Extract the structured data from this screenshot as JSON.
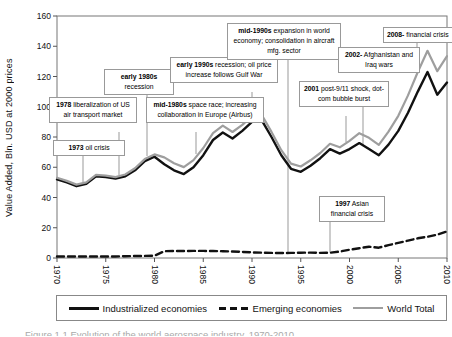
{
  "caption_partial": "Figure 1.1 Evolution of the world aerospace industry, 1970-2010",
  "chart_data": {
    "type": "line",
    "title": "",
    "xlabel": "",
    "ylabel": "Value Added, Bln. USD at 2000 prices",
    "ylim": [
      0,
      160
    ],
    "yticks": [
      0,
      20,
      40,
      60,
      80,
      100,
      120,
      140,
      160
    ],
    "xticks": [
      1970,
      1975,
      1980,
      1985,
      1990,
      1995,
      2000,
      2005,
      2010
    ],
    "grid": false,
    "legend_position": "bottom",
    "years": [
      1970,
      1971,
      1972,
      1973,
      1974,
      1975,
      1976,
      1977,
      1978,
      1979,
      1980,
      1981,
      1982,
      1983,
      1984,
      1985,
      1986,
      1987,
      1988,
      1989,
      1990,
      1991,
      1992,
      1993,
      1994,
      1995,
      1996,
      1997,
      1998,
      1999,
      2000,
      2001,
      2002,
      2003,
      2004,
      2005,
      2006,
      2007,
      2008,
      2009,
      2010
    ],
    "series": [
      {
        "id": "industrialized",
        "name": "Industrialized economies",
        "color": "#111111",
        "width": 2.4,
        "dash": "",
        "values": [
          52,
          50,
          47.5,
          49,
          54,
          53.5,
          52.5,
          54,
          58,
          64,
          67,
          62,
          58,
          55.5,
          60,
          68,
          78,
          83,
          79,
          84,
          90,
          91,
          80,
          68,
          59,
          57,
          61,
          66,
          72,
          69,
          72,
          76,
          72,
          68,
          75,
          84,
          96,
          110,
          123,
          108,
          116
        ]
      },
      {
        "id": "emerging",
        "name": "Emerging economies",
        "color": "#111111",
        "width": 2.4,
        "dash": "7 4",
        "values": [
          1,
          1,
          1,
          1,
          1,
          1,
          1,
          1.2,
          1.3,
          1.4,
          1.5,
          4.5,
          4.6,
          4.6,
          4.7,
          4.7,
          4.6,
          4.5,
          4.3,
          4,
          3.7,
          3.5,
          3.4,
          3.3,
          3.4,
          3.5,
          3.6,
          3.4,
          3.5,
          4.2,
          5.5,
          6.5,
          7.5,
          6.8,
          8.5,
          10,
          11.5,
          13,
          14,
          15.5,
          17.5
        ]
      },
      {
        "id": "world",
        "name": "World Total",
        "color": "#9e9e9e",
        "width": 2.2,
        "dash": "",
        "values": [
          53,
          51,
          48.5,
          50,
          55,
          54.5,
          53.5,
          55.2,
          59.3,
          65.4,
          68.5,
          66.5,
          62.6,
          60.1,
          64.7,
          72.7,
          82.6,
          87.5,
          83.3,
          88,
          93.7,
          94.5,
          83.4,
          71.3,
          62.4,
          60.5,
          64.6,
          69.4,
          75.5,
          73.2,
          77.5,
          82.5,
          79.5,
          74.8,
          83.5,
          94,
          107.5,
          123,
          137,
          123.5,
          133.5
        ]
      }
    ],
    "annotations": [
      {
        "bold": "1973",
        "text": " oil crisis",
        "left": 53,
        "top": 140,
        "width": 72,
        "connector": {
          "x": 83,
          "y1": 155,
          "y2": 182
        }
      },
      {
        "bold": "1978",
        "text": " liberalization of US air transport market",
        "left": 49,
        "top": 97,
        "width": 88,
        "connector": {
          "x": 119,
          "y1": 132,
          "y2": 175
        }
      },
      {
        "bold": "early 1980s",
        "text": " recession",
        "left": 104,
        "top": 69,
        "width": 70,
        "connector": {
          "x": 147,
          "y1": 90,
          "y2": 156
        }
      },
      {
        "bold": "mid-1980s",
        "text": " space race; increasing collaboration in Europe (Airbus)",
        "left": 146,
        "top": 97,
        "width": 118,
        "connector": {
          "x": 196,
          "y1": 132,
          "y2": 154
        }
      },
      {
        "bold": "early 1990s",
        "text": " recession; oil price increase follows Gulf War",
        "left": 170,
        "top": 57,
        "width": 108,
        "connector": {
          "x": 252,
          "y1": 92,
          "y2": 119
        }
      },
      {
        "bold": "mid-1990s",
        "text": " expansion in world economy; consolidation in aircraft mfg. sector",
        "left": 227,
        "top": 23,
        "width": 114,
        "connector": {
          "x": 288,
          "y1": 58,
          "y2": 252
        }
      },
      {
        "bold": "1997",
        "text": " Asian financial crisis",
        "left": 319,
        "top": 196,
        "width": 66,
        "connector": {
          "x": 330,
          "y1": 218,
          "y2": 252
        }
      },
      {
        "bold": "2001",
        "text": " post-9/11 shock, dot-com bubble burst",
        "left": 299,
        "top": 81,
        "width": 90,
        "connector": {
          "x": 346,
          "y1": 116,
          "y2": 142
        }
      },
      {
        "bold": "2002-",
        "text": " Afghanistan and Iraq wars",
        "left": 338,
        "top": 47,
        "width": 82,
        "connector": {
          "x": 363,
          "y1": 82,
          "y2": 145
        }
      },
      {
        "bold": "2008-",
        "text": " financial crisis",
        "left": 383,
        "top": 27,
        "width": 0,
        "nowrap": true,
        "connector": {
          "x": 417,
          "y1": 40,
          "y2": 62
        }
      }
    ]
  }
}
